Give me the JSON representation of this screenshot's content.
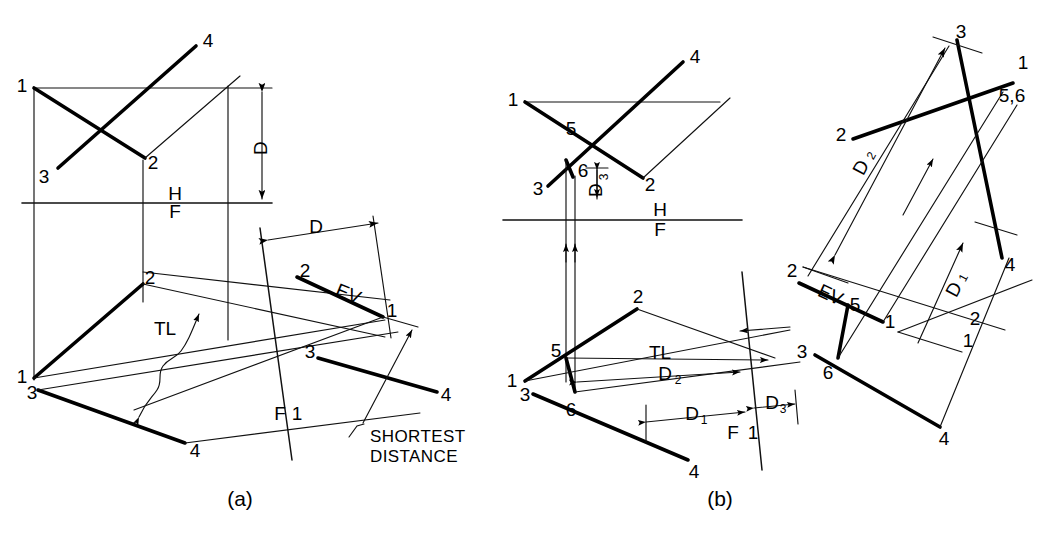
{
  "figure": {
    "title_a": "(a)",
    "title_b": "(b)",
    "type": "descriptive-geometry-drawing",
    "topic": "Shortest distance between two skew lines using auxiliary views"
  },
  "panel_a": {
    "caption": "(a)",
    "reference_lines": {
      "h": "H",
      "f": "F",
      "f1": "F",
      "one": "1"
    },
    "dimensions": {
      "d_top": "D",
      "d_aux": "D"
    },
    "annotations": {
      "tl": "TL",
      "ev": "EV",
      "shortest_line1": "SHORTEST",
      "shortest_line2": "DISTANCE"
    },
    "points": {
      "top_view": [
        "1",
        "3",
        "4",
        "2"
      ],
      "front_view": [
        "2",
        "1",
        "3",
        "4"
      ],
      "aux_view": [
        "2",
        "1",
        "3",
        "4"
      ]
    }
  },
  "panel_b": {
    "caption": "(b)",
    "reference_lines": {
      "h": "H",
      "f": "F",
      "f1": "F",
      "one": "1"
    },
    "dimensions": {
      "d1": "D",
      "d1_sub": "1",
      "d2": "D",
      "d2_sub": "2",
      "d3": "D",
      "d3_sub": "3"
    },
    "annotations": {
      "tl": "TL",
      "ev": "EV"
    },
    "points": {
      "top_view": [
        "1",
        "5",
        "3",
        "6",
        "2",
        "4"
      ],
      "front_view": [
        "2",
        "5",
        "1",
        "3",
        "6",
        "4"
      ],
      "aux_view_1": [
        "2",
        "5",
        "1",
        "3",
        "6",
        "4"
      ],
      "aux_view_2": [
        "3",
        "1",
        "5,6",
        "2",
        "4",
        "2",
        "1"
      ]
    }
  },
  "colors": {
    "ink": "#000000",
    "thin_ink": "#111111",
    "background": "#ffffff"
  }
}
